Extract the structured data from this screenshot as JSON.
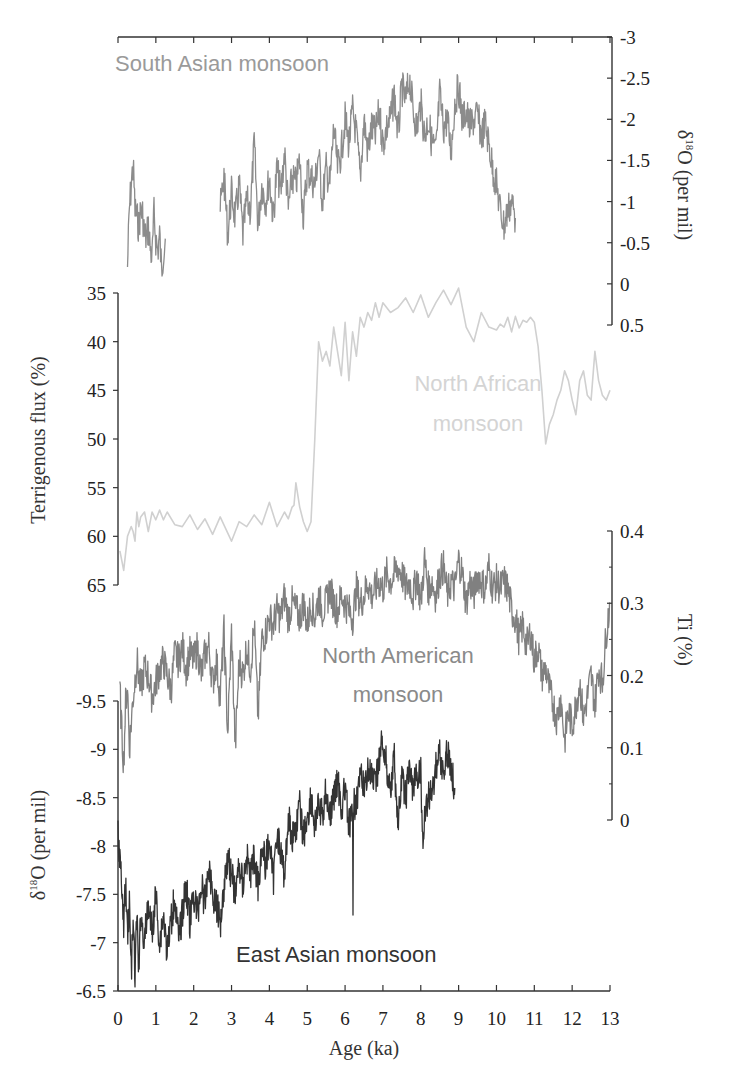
{
  "chart_data": {
    "type": "line",
    "title": "",
    "xlabel": "Age (ka)",
    "xlim": [
      0,
      13
    ],
    "x_ticks": [
      0,
      1,
      2,
      3,
      4,
      5,
      6,
      7,
      8,
      9,
      10,
      11,
      12,
      13
    ],
    "grid": false,
    "legend": "inline text labels",
    "series": [
      {
        "name": "South Asian monsoon",
        "label_text": "South Asian monsoon",
        "axis": "right-top",
        "ylabel": "δ18O (per mil)",
        "ylim": [
          -3,
          0.5
        ],
        "y_inverted": true,
        "y_ticks": [
          "-3",
          "-2.5",
          "-2",
          "-1.5",
          "-1",
          "-0.5",
          "0",
          "0.5"
        ],
        "color": "#8c8c8c",
        "segments": [
          {
            "x": [
              0.25,
              0.3,
              0.35,
              0.4,
              0.45,
              0.5,
              0.55,
              0.6,
              0.65,
              0.7,
              0.75,
              0.8,
              0.85,
              0.9,
              0.95,
              1.0,
              1.05,
              1.1,
              1.15,
              1.2,
              1.25
            ],
            "y": [
              -0.2,
              -0.9,
              -1.2,
              -1.45,
              -0.9,
              -0.8,
              -0.7,
              -0.9,
              -0.85,
              -0.6,
              -0.55,
              -0.7,
              -0.45,
              -0.3,
              -0.85,
              -0.55,
              -0.4,
              -0.6,
              -0.15,
              -0.4,
              -0.55
            ]
          },
          {
            "x": [
              2.7,
              2.8,
              2.9,
              3.0,
              3.1,
              3.2,
              3.3,
              3.4,
              3.5,
              3.6,
              3.7,
              3.8,
              3.9,
              4.0,
              4.1,
              4.2,
              4.3,
              4.4,
              4.5,
              4.6,
              4.7,
              4.8,
              4.9,
              5.0,
              5.1,
              5.2,
              5.3,
              5.4,
              5.5,
              5.6,
              5.7,
              5.8,
              5.9,
              6.0,
              6.1,
              6.2,
              6.3,
              6.4,
              6.5,
              6.6,
              6.7,
              6.8,
              6.9,
              7.0,
              7.1,
              7.2,
              7.3,
              7.4,
              7.5,
              7.6,
              7.7,
              7.8,
              7.9,
              8.0,
              8.1,
              8.2,
              8.3,
              8.4,
              8.5,
              8.6,
              8.7,
              8.8,
              8.9,
              9.0,
              9.1,
              9.2,
              9.3,
              9.4,
              9.5,
              9.6,
              9.7,
              9.8,
              9.9,
              10.0,
              10.1,
              10.2,
              10.3,
              10.4,
              10.5
            ],
            "y": [
              -0.9,
              -1.3,
              -0.6,
              -1.1,
              -0.8,
              -1.2,
              -0.6,
              -1.0,
              -0.9,
              -1.7,
              -0.7,
              -1.2,
              -1.0,
              -1.3,
              -0.8,
              -1.4,
              -1.1,
              -1.6,
              -0.9,
              -1.3,
              -1.2,
              -1.5,
              -0.8,
              -1.4,
              -1.3,
              -1.2,
              -1.6,
              -1.0,
              -1.4,
              -1.2,
              -1.9,
              -1.4,
              -1.6,
              -2.0,
              -1.7,
              -2.1,
              -1.8,
              -1.3,
              -2.0,
              -1.6,
              -1.9,
              -1.8,
              -2.1,
              -1.7,
              -1.9,
              -2.0,
              -2.3,
              -1.8,
              -2.4,
              -2.2,
              -2.5,
              -2.1,
              -1.9,
              -2.2,
              -1.8,
              -2.0,
              -1.7,
              -1.6,
              -2.3,
              -1.9,
              -2.0,
              -1.6,
              -2.2,
              -2.4,
              -2.0,
              -2.1,
              -1.9,
              -2.0,
              -2.05,
              -1.8,
              -1.95,
              -1.7,
              -1.4,
              -1.2,
              -0.9,
              -0.7,
              -0.9,
              -1.0,
              -0.8
            ]
          }
        ]
      },
      {
        "name": "North African monsoon",
        "label_text": [
          "North African",
          "monsoon"
        ],
        "axis": "left-upper",
        "ylabel": "Terrigenous flux (%)",
        "ylim": [
          35,
          65
        ],
        "y_inverted": true,
        "y_ticks": [
          "35",
          "40",
          "45",
          "50",
          "55",
          "60",
          "65"
        ],
        "color": "#d0d0d0",
        "x": [
          0.05,
          0.15,
          0.25,
          0.35,
          0.4,
          0.45,
          0.5,
          0.55,
          0.6,
          0.7,
          0.75,
          0.8,
          0.9,
          1.0,
          1.1,
          1.2,
          1.3,
          1.5,
          1.7,
          1.9,
          2.1,
          2.3,
          2.5,
          2.7,
          3.0,
          3.2,
          3.4,
          3.6,
          3.8,
          4.0,
          4.2,
          4.4,
          4.5,
          4.6,
          4.65,
          4.7,
          4.8,
          4.9,
          5.0,
          5.1,
          5.2,
          5.3,
          5.4,
          5.5,
          5.6,
          5.7,
          5.8,
          5.9,
          6.0,
          6.1,
          6.2,
          6.3,
          6.4,
          6.5,
          6.6,
          6.7,
          6.8,
          6.9,
          7.0,
          7.2,
          7.4,
          7.6,
          7.8,
          8.0,
          8.2,
          8.4,
          8.6,
          8.8,
          9.0,
          9.2,
          9.4,
          9.6,
          9.8,
          10.0,
          10.1,
          10.2,
          10.3,
          10.4,
          10.5,
          10.6,
          10.7,
          10.8,
          10.9,
          11.0,
          11.1,
          11.2,
          11.3,
          11.4,
          11.5,
          11.6,
          11.7,
          11.8,
          11.9,
          12.0,
          12.1,
          12.2,
          12.3,
          12.4,
          12.5,
          12.6,
          12.7,
          12.8,
          12.9,
          13.0
        ],
        "y": [
          61.5,
          63.5,
          60,
          59,
          59.5,
          60.5,
          57.5,
          59,
          58,
          57.5,
          58.5,
          59.5,
          57.5,
          58.3,
          57.3,
          58.3,
          57.5,
          58.8,
          59.0,
          57.8,
          59.3,
          58.2,
          59.8,
          58,
          60.5,
          58.5,
          59.0,
          57.8,
          58.8,
          56.5,
          59,
          57.5,
          58.2,
          57.0,
          56.8,
          54.5,
          57,
          58.5,
          59.5,
          58.5,
          50,
          40,
          42,
          41,
          42.5,
          38.5,
          41,
          43.5,
          38,
          44,
          39,
          41.5,
          37.5,
          38.5,
          37,
          37.8,
          36,
          37.5,
          36,
          37.0,
          36.5,
          35.5,
          37,
          35.2,
          37.5,
          36,
          34.7,
          36.2,
          34.5,
          38.5,
          40,
          37,
          38.5,
          38.8,
          38.2,
          38.5,
          37.5,
          39,
          37.4,
          38.6,
          37.8,
          38,
          37.5,
          38,
          40.5,
          45,
          50.5,
          48.5,
          47.5,
          46,
          45,
          43,
          44,
          46,
          47.5,
          44,
          43,
          45.5,
          46,
          41,
          44,
          45.5,
          46,
          45
        ],
        "note": "sparse polyline, x values approximated from pixel positions"
      },
      {
        "name": "North American monsoon",
        "label_text": [
          "North American",
          "monsoon"
        ],
        "axis": "right-lower",
        "ylabel": "Ti (%)",
        "ylim": [
          0,
          0.4
        ],
        "y_inverted": false,
        "y_ticks": [
          "0",
          "0.1",
          "0.2",
          "0.3",
          "0.4"
        ],
        "color": "#808080",
        "x": [
          0.05,
          0.1,
          0.15,
          0.2,
          0.25,
          0.3,
          0.4,
          0.5,
          0.6,
          0.7,
          0.8,
          0.9,
          1.0,
          1.1,
          1.2,
          1.3,
          1.4,
          1.5,
          1.6,
          1.7,
          1.8,
          1.9,
          2.0,
          2.1,
          2.2,
          2.3,
          2.4,
          2.5,
          2.6,
          2.7,
          2.8,
          2.9,
          3.0,
          3.1,
          3.2,
          3.3,
          3.4,
          3.5,
          3.6,
          3.7,
          3.8,
          3.9,
          4.0,
          4.1,
          4.2,
          4.3,
          4.4,
          4.5,
          4.6,
          4.7,
          4.8,
          4.9,
          5.0,
          5.1,
          5.2,
          5.3,
          5.4,
          5.5,
          5.6,
          5.7,
          5.8,
          5.9,
          6.0,
          6.1,
          6.2,
          6.3,
          6.4,
          6.5,
          6.6,
          6.7,
          6.8,
          6.9,
          7.0,
          7.1,
          7.2,
          7.3,
          7.4,
          7.5,
          7.6,
          7.7,
          7.8,
          7.9,
          8.0,
          8.1,
          8.2,
          8.3,
          8.4,
          8.5,
          8.6,
          8.7,
          8.8,
          8.9,
          9.0,
          9.1,
          9.2,
          9.3,
          9.4,
          9.5,
          9.6,
          9.7,
          9.8,
          9.9,
          10.0,
          10.1,
          10.2,
          10.3,
          10.4,
          10.5,
          10.6,
          10.7,
          10.8,
          10.9,
          11.0,
          11.1,
          11.2,
          11.3,
          11.4,
          11.5,
          11.6,
          11.7,
          11.8,
          11.9,
          12.0,
          12.1,
          12.2,
          12.3,
          12.4,
          12.5,
          12.6,
          12.7,
          12.8,
          12.9,
          13.0
        ],
        "y": [
          0.18,
          0.12,
          0.08,
          0.16,
          0.19,
          0.1,
          0.17,
          0.22,
          0.18,
          0.21,
          0.2,
          0.17,
          0.19,
          0.21,
          0.22,
          0.2,
          0.18,
          0.23,
          0.22,
          0.24,
          0.21,
          0.23,
          0.22,
          0.24,
          0.2,
          0.23,
          0.24,
          0.19,
          0.22,
          0.17,
          0.26,
          0.12,
          0.26,
          0.1,
          0.22,
          0.2,
          0.24,
          0.21,
          0.27,
          0.14,
          0.25,
          0.26,
          0.28,
          0.27,
          0.29,
          0.28,
          0.31,
          0.28,
          0.3,
          0.29,
          0.28,
          0.3,
          0.27,
          0.3,
          0.28,
          0.31,
          0.29,
          0.3,
          0.32,
          0.3,
          0.29,
          0.31,
          0.3,
          0.29,
          0.28,
          0.32,
          0.3,
          0.31,
          0.33,
          0.31,
          0.32,
          0.33,
          0.32,
          0.34,
          0.33,
          0.34,
          0.35,
          0.34,
          0.32,
          0.33,
          0.31,
          0.34,
          0.3,
          0.36,
          0.32,
          0.33,
          0.31,
          0.34,
          0.35,
          0.31,
          0.33,
          0.32,
          0.36,
          0.34,
          0.3,
          0.33,
          0.31,
          0.34,
          0.33,
          0.32,
          0.35,
          0.32,
          0.33,
          0.32,
          0.33,
          0.32,
          0.29,
          0.28,
          0.25,
          0.27,
          0.24,
          0.26,
          0.22,
          0.24,
          0.2,
          0.21,
          0.18,
          0.16,
          0.14,
          0.17,
          0.11,
          0.15,
          0.13,
          0.16,
          0.19,
          0.14,
          0.17,
          0.2,
          0.16,
          0.21,
          0.19,
          0.26,
          0.3
        ]
      },
      {
        "name": "East Asian monsoon",
        "label_text": "East Asian monsoon",
        "axis": "left-lower",
        "ylabel": "δ18O (per mil)",
        "ylim": [
          -9.5,
          -6.5
        ],
        "y_inverted": false,
        "y_ticks": [
          "-9.5",
          "-9",
          "-8.5",
          "-8",
          "-7.5",
          "-7",
          "-6.5"
        ],
        "color": "#333333",
        "x": [
          0.0,
          0.05,
          0.1,
          0.15,
          0.2,
          0.25,
          0.3,
          0.35,
          0.4,
          0.45,
          0.5,
          0.55,
          0.6,
          0.7,
          0.8,
          0.9,
          1.0,
          1.1,
          1.2,
          1.3,
          1.4,
          1.5,
          1.6,
          1.7,
          1.8,
          1.9,
          2.0,
          2.1,
          2.2,
          2.3,
          2.4,
          2.5,
          2.6,
          2.7,
          2.8,
          2.9,
          3.0,
          3.1,
          3.2,
          3.3,
          3.4,
          3.5,
          3.6,
          3.7,
          3.8,
          3.9,
          4.0,
          4.1,
          4.2,
          4.3,
          4.4,
          4.5,
          4.6,
          4.7,
          4.8,
          4.9,
          5.0,
          5.1,
          5.2,
          5.3,
          5.4,
          5.5,
          5.6,
          5.7,
          5.8,
          5.9,
          6.0,
          6.1,
          6.2,
          6.21,
          6.22,
          6.3,
          6.4,
          6.5,
          6.6,
          6.7,
          6.8,
          6.9,
          7.0,
          7.1,
          7.2,
          7.3,
          7.4,
          7.5,
          7.6,
          7.7,
          7.8,
          7.9,
          8.0,
          8.05,
          8.1,
          8.2,
          8.3,
          8.4,
          8.5,
          8.6,
          8.7,
          8.8,
          8.9
        ],
        "y": [
          -8.1,
          -7.9,
          -7.5,
          -7.2,
          -7.6,
          -7.1,
          -7.4,
          -6.7,
          -7.2,
          -6.65,
          -7.3,
          -6.7,
          -7.3,
          -7.0,
          -7.4,
          -7.1,
          -7.5,
          -7.0,
          -7.3,
          -6.9,
          -7.2,
          -7.5,
          -7.0,
          -7.3,
          -7.6,
          -7.2,
          -7.5,
          -7.3,
          -7.6,
          -7.4,
          -7.8,
          -7.5,
          -7.4,
          -7.2,
          -7.6,
          -7.9,
          -7.7,
          -7.5,
          -7.8,
          -7.6,
          -7.9,
          -7.7,
          -7.9,
          -7.6,
          -8.0,
          -7.8,
          -8.1,
          -7.6,
          -8.2,
          -7.9,
          -7.7,
          -8.3,
          -8.1,
          -8.2,
          -8.4,
          -8.1,
          -8.3,
          -8.5,
          -8.2,
          -8.4,
          -8.3,
          -8.6,
          -8.3,
          -8.5,
          -8.7,
          -8.4,
          -8.6,
          -8.2,
          -8.3,
          -7.2,
          -8.4,
          -8.5,
          -8.7,
          -8.6,
          -8.8,
          -8.7,
          -8.6,
          -8.9,
          -9.1,
          -8.8,
          -8.6,
          -8.9,
          -8.2,
          -8.7,
          -8.5,
          -8.8,
          -8.6,
          -8.7,
          -8.8,
          -8.0,
          -8.3,
          -8.5,
          -8.6,
          -8.8,
          -9.0,
          -8.7,
          -9.0,
          -8.8,
          -8.6
        ]
      }
    ],
    "axes": {
      "left_upper": {
        "title": "Terrigenous flux (%)",
        "ticks": [
          "35",
          "40",
          "45",
          "50",
          "55",
          "60",
          "65"
        ]
      },
      "left_lower": {
        "title": "δ18O (per mil)",
        "ticks": [
          "-9.5",
          "-9",
          "-8.5",
          "-8",
          "-7.5",
          "-7",
          "-6.5"
        ]
      },
      "right_upper": {
        "title": "δ18O (per mil)",
        "ticks": [
          "-3",
          "-2.5",
          "-2",
          "-1.5",
          "-1",
          "-0.5",
          "0",
          "0.5"
        ]
      },
      "right_lower": {
        "title": "Ti (%)",
        "ticks": [
          "0.4",
          "0.3",
          "0.2",
          "0.1",
          "0"
        ]
      },
      "bottom": {
        "title": "Age (ka)",
        "ticks": [
          "0",
          "1",
          "2",
          "3",
          "4",
          "5",
          "6",
          "7",
          "8",
          "9",
          "10",
          "11",
          "12",
          "13"
        ]
      }
    }
  },
  "labels": {
    "south_asian": "South Asian monsoon",
    "north_african_1": "North African",
    "north_african_2": "monsoon",
    "north_american_1": "North American",
    "north_american_2": "monsoon",
    "east_asian": "East Asian monsoon",
    "x_axis_title": "Age (ka)",
    "left_upper_title": "Terrigenous flux (%)",
    "left_lower_title_prefix": "δ",
    "left_lower_title_sup": "18",
    "left_lower_title_rest": "O (per mil)",
    "right_upper_title_prefix": "δ",
    "right_upper_title_sup": "18",
    "right_upper_title_rest": "O (per mil)",
    "right_lower_title": "Ti (%)"
  },
  "colors": {
    "south_asian": "#8c8c8c",
    "north_african": "#d0d0d0",
    "north_american": "#808080",
    "east_asian": "#333333",
    "axis": "#333333"
  }
}
